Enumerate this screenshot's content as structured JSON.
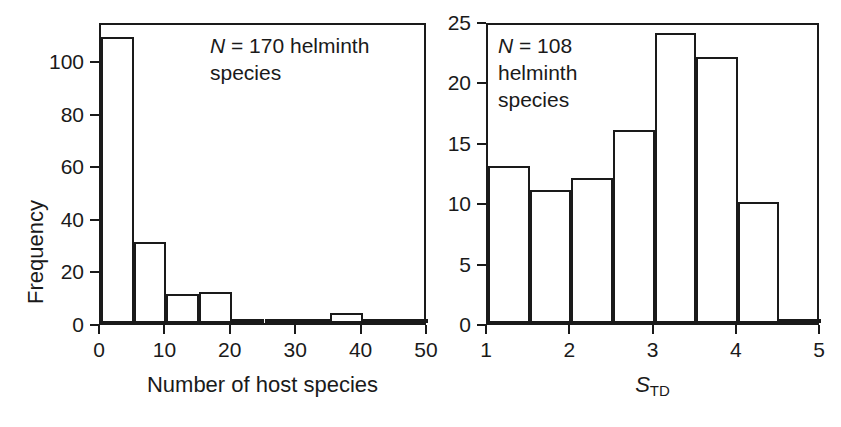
{
  "figure": {
    "background": "#ffffff",
    "ink_color": "#1a1a1a",
    "panel_count": 2
  },
  "chart_data": [
    {
      "panel": "left",
      "type": "bar",
      "title": "",
      "annotation": "N = 170 helminth species",
      "annotation_n": 170,
      "annotation_unit": "helminth species",
      "xlabel": "Number of host species",
      "ylabel": "Frequency",
      "xlim": [
        0,
        50
      ],
      "ylim": [
        0,
        115
      ],
      "xticks": [
        0,
        10,
        20,
        30,
        40,
        50
      ],
      "xtick_labels": [
        "0",
        "10",
        "20",
        "30",
        "40",
        "50"
      ],
      "yticks": [
        0,
        20,
        40,
        60,
        80,
        100
      ],
      "ytick_labels": [
        "0",
        "20",
        "40",
        "60",
        "80",
        "100"
      ],
      "grid": false,
      "legend": false,
      "bin_width": 5,
      "bin_edges": [
        0,
        5,
        10,
        15,
        20,
        25,
        30,
        35,
        40,
        45,
        50
      ],
      "categories": [
        "0-5",
        "5-10",
        "10-15",
        "15-20",
        "20-25",
        "25-30",
        "30-35",
        "35-40",
        "40-45",
        "45-50"
      ],
      "values": [
        109,
        31,
        11,
        12,
        1,
        0,
        1,
        4,
        1,
        0
      ]
    },
    {
      "panel": "right",
      "type": "bar",
      "title": "",
      "annotation": "N = 108\nhelminth\nspecies",
      "annotation_n": 108,
      "annotation_unit": "helminth species",
      "xlabel": "S_TD",
      "xlabel_base": "S",
      "xlabel_subscript": "TD",
      "ylabel": "",
      "xlim": [
        1,
        5
      ],
      "ylim": [
        0,
        25
      ],
      "xticks": [
        1,
        2,
        3,
        4,
        5
      ],
      "xtick_labels": [
        "1",
        "2",
        "3",
        "4",
        "5"
      ],
      "yticks": [
        0,
        5,
        10,
        15,
        20,
        25
      ],
      "ytick_labels": [
        "0",
        "5",
        "10",
        "15",
        "20",
        "25"
      ],
      "grid": false,
      "legend": false,
      "bin_width": 0.5,
      "bin_edges": [
        1,
        1.5,
        2,
        2.5,
        3,
        3.5,
        4,
        4.5,
        5
      ],
      "categories": [
        "1-1.5",
        "1.5-2",
        "2-2.5",
        "2.5-3",
        "3-3.5",
        "3.5-4",
        "4-4.5",
        "4.5-5"
      ],
      "values": [
        13,
        11,
        12,
        16,
        24,
        22,
        10,
        0
      ]
    }
  ]
}
